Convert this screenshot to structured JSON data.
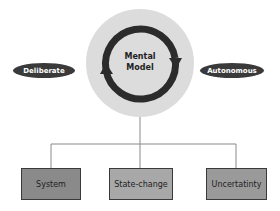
{
  "diagram": {
    "center": {
      "line1": "Mental",
      "line2": "Model"
    },
    "left_pill": "Deliberate",
    "right_pill": "Autonomous",
    "boxes": [
      {
        "label": "System",
        "fill": "#8a8a8a"
      },
      {
        "label": "State-change",
        "fill": "#a8a8a8"
      },
      {
        "label": "Uncertatinty",
        "fill": "#9a9a9a"
      }
    ]
  },
  "colors": {
    "circle_fill": "#d9d9d9",
    "ring": "#2b2b2b",
    "pill": "#3a3a3a",
    "connector": "#888888"
  }
}
